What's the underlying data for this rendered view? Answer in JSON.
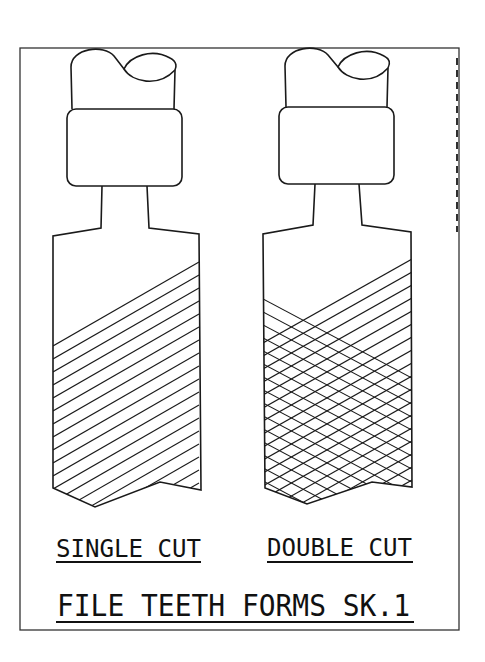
{
  "drawing": {
    "title": "FILE TEETH FORMS SK.1",
    "colors": {
      "ink": "#1a1a1a",
      "paper": "#ffffff"
    },
    "figures": [
      {
        "id": "single-cut",
        "label": "SINGLE CUT",
        "hatch": "single diagonal"
      },
      {
        "id": "double-cut",
        "label": "DOUBLE CUT",
        "hatch": "crosshatch"
      }
    ]
  }
}
